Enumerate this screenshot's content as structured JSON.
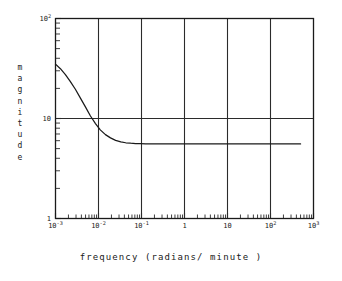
{
  "chart_data": {
    "type": "line",
    "title": "",
    "xlabel": "frequency (radians/ minute )",
    "ylabel": "magnitude",
    "xscale": "log",
    "yscale": "log",
    "xlim": [
      0.001,
      1000
    ],
    "ylim": [
      1,
      100
    ],
    "grid": true,
    "grid_style": "major decade gridlines, both axes",
    "legend": "none",
    "xticks": [
      {
        "value": 0.001,
        "label": "10",
        "exp": "-3"
      },
      {
        "value": 0.01,
        "label": "10",
        "exp": "-2"
      },
      {
        "value": 0.1,
        "label": "10",
        "exp": "-1"
      },
      {
        "value": 1,
        "label": "1",
        "exp": ""
      },
      {
        "value": 10,
        "label": "10",
        "exp": ""
      },
      {
        "value": 100,
        "label": "10",
        "exp": "2"
      },
      {
        "value": 1000,
        "label": "10",
        "exp": "3"
      }
    ],
    "yticks": [
      {
        "value": 1,
        "label": "1",
        "exp": ""
      },
      {
        "value": 10,
        "label": "10",
        "exp": ""
      },
      {
        "value": 100,
        "label": "10",
        "exp": "2"
      }
    ],
    "series": [
      {
        "name": "magnitude response",
        "x": [
          0.001,
          0.0013,
          0.0017,
          0.0022,
          0.0029,
          0.0038,
          0.005,
          0.0065,
          0.0085,
          0.011,
          0.0145,
          0.019,
          0.025,
          0.033,
          0.043,
          0.056,
          0.073,
          0.095,
          0.125,
          0.16,
          0.21,
          0.28,
          0.36,
          0.47,
          0.62,
          0.81,
          1.05,
          2.0,
          5.0,
          10.0,
          50.0,
          100.0,
          500.0
        ],
        "y": [
          35.0,
          31.5,
          27.5,
          23.5,
          19.6,
          16.0,
          13.0,
          10.6,
          8.9,
          7.7,
          6.9,
          6.4,
          6.05,
          5.85,
          5.72,
          5.66,
          5.62,
          5.6,
          5.58,
          5.57,
          5.57,
          5.56,
          5.56,
          5.56,
          5.56,
          5.56,
          5.56,
          5.56,
          5.56,
          5.56,
          5.56,
          5.56,
          5.56
        ]
      }
    ],
    "annotations": {
      "dc_gain": 35.0,
      "asymptote": 5.56,
      "crossing_of_10": 0.0065,
      "curve_end_x": 500
    }
  },
  "axes": {
    "ylabel_letters": [
      "m",
      "a",
      "g",
      "n",
      "i",
      "t",
      "u",
      "d",
      "e"
    ]
  }
}
